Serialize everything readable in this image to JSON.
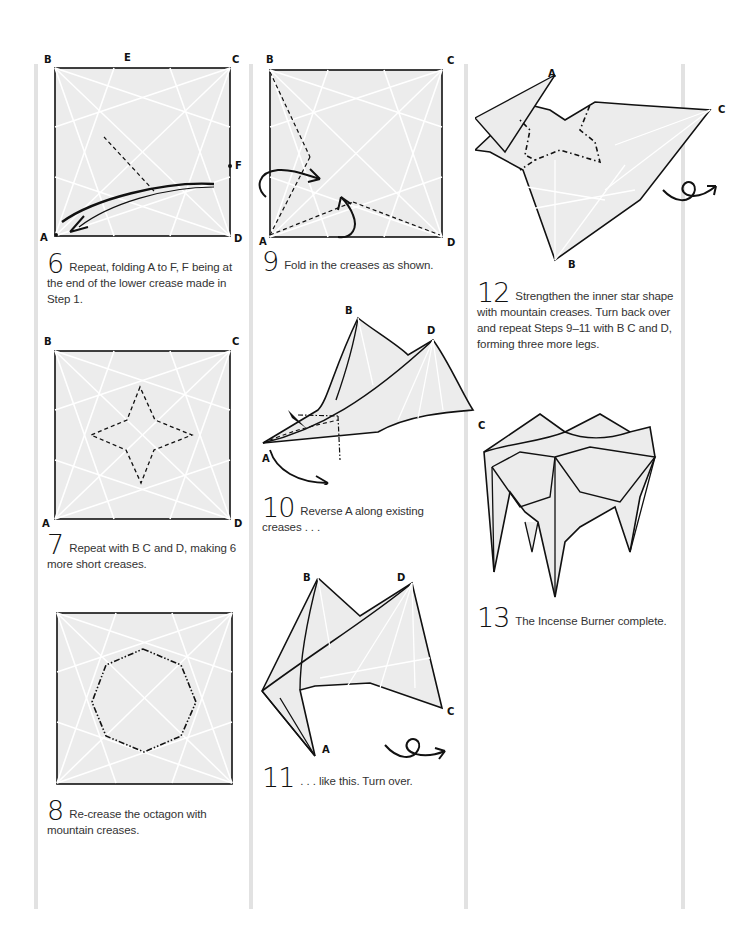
{
  "colors": {
    "paper_fill": "#ececec",
    "line": "#111111",
    "crease": "#ffffff",
    "column_bar": "#e2e2e2"
  },
  "steps": [
    {
      "number": "6",
      "text": "Repeat, folding A to F, F being at the end of the lower crease made in Step 1.",
      "labels": {
        "B": "B",
        "E": "E",
        "C": "C",
        "F": "F",
        "A": "A",
        "D": "D"
      }
    },
    {
      "number": "7",
      "text": "Repeat with B C and D, making 6 more short creases.",
      "labels": {
        "B": "B",
        "C": "C",
        "A": "A",
        "D": "D"
      }
    },
    {
      "number": "8",
      "text": "Re-crease the octagon with mountain creases."
    },
    {
      "number": "9",
      "text": "Fold in the creases as shown.",
      "labels": {
        "B": "B",
        "C": "C",
        "A": "A",
        "D": "D"
      }
    },
    {
      "number": "10",
      "text": "Reverse A along existing creases . . .",
      "labels": {
        "B": "B",
        "D": "D",
        "C": "C",
        "A": "A"
      }
    },
    {
      "number": "11",
      "text": ". . . like this. Turn over.",
      "labels": {
        "B": "B",
        "D": "D",
        "C": "C",
        "A": "A"
      }
    },
    {
      "number": "12",
      "text": "Strengthen the inner star shape with mountain creases. Turn back over and repeat Steps 9–11 with B C and D, forming three more legs.",
      "labels": {
        "A": "A",
        "C": "C",
        "B": "B"
      }
    },
    {
      "number": "13",
      "text": "The Incense Burner complete."
    }
  ],
  "icons": {
    "turn_over": "turn-over-icon"
  }
}
